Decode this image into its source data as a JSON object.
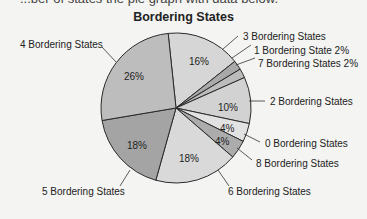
{
  "page": {
    "cutoff_text": "...ber of states the pie graph with data below.",
    "background": "#f4f4f2"
  },
  "chart_data": {
    "type": "pie",
    "title": "Bordering States",
    "start_angle_deg": -6,
    "direction": "clockwise",
    "slices": [
      {
        "label": "3 Bordering States",
        "value": 16,
        "pct_label": "16%",
        "color": "#d6d6d6"
      },
      {
        "label": "1 Bordering State 2%",
        "value": 2,
        "pct_label": "",
        "color": "#a9a9a9"
      },
      {
        "label": "7 Bordering States 2%",
        "value": 2,
        "pct_label": "",
        "color": "#bcbcbc"
      },
      {
        "label": "2 Bordering States",
        "value": 10,
        "pct_label": "10%",
        "color": "#d2d2d2"
      },
      {
        "label": "0 Bordering States",
        "value": 4,
        "pct_label": "4%",
        "color": "#e2e2e2"
      },
      {
        "label": "8 Bordering States",
        "value": 4,
        "pct_label": "4%",
        "color": "#acacac"
      },
      {
        "label": "6 Bordering States",
        "value": 18,
        "pct_label": "18%",
        "color": "#d9d9d9"
      },
      {
        "label": "5 Bordering States",
        "value": 18,
        "pct_label": "18%",
        "color": "#a4a4a4"
      },
      {
        "label": "4 Bordering States",
        "value": 26,
        "pct_label": "26%",
        "color": "#bdbdbd"
      }
    ]
  }
}
